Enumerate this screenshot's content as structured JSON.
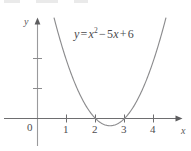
{
  "figure": {
    "width": 191,
    "height": 151,
    "background": "#ffffff",
    "curve_color": "#8c8c8e",
    "axis_color": "#6e6e70",
    "text_color": "#4d4d4f"
  },
  "equation": {
    "lhs": "y",
    "equals": "=",
    "base": "x",
    "exponent": "2",
    "minus": "−",
    "linear_coeff": "5",
    "linear_var": "x",
    "plus": "+",
    "constant": "6",
    "full_text": "y = x² − 5x + 6"
  },
  "axes": {
    "x_axis_name": "x",
    "y_axis_name": "y",
    "origin_label": "0",
    "x_tick_labels": [
      "1",
      "2",
      "3",
      "4"
    ],
    "y_tick_labels": []
  },
  "chart_data": {
    "type": "line",
    "title": "",
    "subtitle": "",
    "xlabel": "x",
    "ylabel": "y",
    "grid": false,
    "legend": null,
    "annotations": [
      "y = x² − 5x + 6"
    ],
    "xlim": [
      -0.35,
      4.8
    ],
    "ylim": [
      -0.55,
      3.4
    ],
    "xticks": [
      1,
      2,
      3,
      4
    ],
    "xticklabels": [
      "1",
      "2",
      "3",
      "4"
    ],
    "yticks": [
      1,
      2
    ],
    "yticklabels": [
      "",
      ""
    ],
    "origin_label": "0",
    "series": [
      {
        "name": "y = x^2 - 5x + 6",
        "equation": "y = x^2 - 5x + 6",
        "coefficients": {
          "a": 1,
          "b": -5,
          "c": 6
        },
        "roots": [
          2,
          3
        ],
        "vertex": [
          2.5,
          -0.25
        ],
        "y_intercept": 6,
        "color": "#8c8c8e",
        "x": [
          0.8,
          1.0,
          1.2,
          1.4,
          1.6,
          1.8,
          2.0,
          2.2,
          2.4,
          2.5,
          2.6,
          2.8,
          3.0,
          3.2,
          3.4,
          3.6,
          3.8,
          4.0,
          4.2,
          4.4,
          4.6
        ],
        "y": [
          2.64,
          2.0,
          1.44,
          0.96,
          0.56,
          0.24,
          0.0,
          -0.16,
          -0.24,
          -0.25,
          -0.24,
          -0.16,
          0.0,
          0.24,
          0.56,
          0.96,
          1.44,
          2.0,
          2.64,
          3.36,
          4.16
        ]
      }
    ]
  }
}
